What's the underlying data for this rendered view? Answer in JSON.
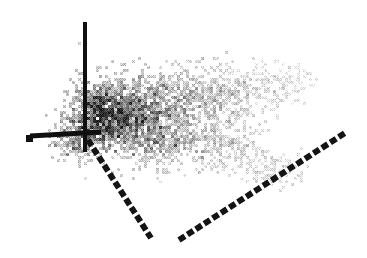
{
  "figure": {
    "name": "3d-scatter-plot",
    "width": 367,
    "height": 258,
    "background_color": "#ffffff",
    "render_style": "dithered-halftone-grayscale",
    "alt_text": "Low-resolution dithered grayscale 3D scatter plot showing a comet-shaped point cloud with three coordinate axes"
  },
  "chart_data": {
    "type": "scatter",
    "title": "",
    "subtitle": "",
    "xlabel": "",
    "ylabel": "",
    "zlabel": "",
    "legend": [],
    "annotations": [],
    "grid": false,
    "axes_labels_visible": false,
    "tick_labels_visible": false,
    "projection": "3d-isometric",
    "origin": {
      "x": 85,
      "y": 133
    },
    "axes": [
      {
        "name": "vertical-axis",
        "style": "solid",
        "color": "#101010",
        "thickness": 4,
        "from": {
          "x": 85,
          "y": 22
        },
        "to": {
          "x": 85,
          "y": 152
        },
        "cap": "square"
      },
      {
        "name": "horizontal-left-axis",
        "style": "solid",
        "color": "#101010",
        "thickness": 5,
        "from": {
          "x": 30,
          "y": 136
        },
        "to": {
          "x": 101,
          "y": 132
        },
        "cap": "square"
      },
      {
        "name": "depth-axis-front-left",
        "style": "dashed",
        "color": "#141414",
        "thickness": 6,
        "dash": 7,
        "gap": 3,
        "from": {
          "x": 88,
          "y": 140
        },
        "to": {
          "x": 151,
          "y": 238
        },
        "cap": "square"
      },
      {
        "name": "depth-axis-front-right",
        "style": "dashed",
        "color": "#141414",
        "thickness": 6,
        "dash": 7,
        "gap": 3,
        "from": {
          "x": 179,
          "y": 240
        },
        "to": {
          "x": 345,
          "y": 133
        },
        "cap": "square"
      }
    ],
    "cloud": {
      "shape": "comet-fan",
      "x_range": [
        55,
        312
      ],
      "y_range": [
        60,
        192
      ],
      "point_count": 2600,
      "density_peak": {
        "x": 112,
        "y": 118
      },
      "gray_min": "#3a3a3a",
      "gray_max": "#f0f0f0",
      "description": "Dense dark core near origin fading rightward to sparse light-gray specks",
      "lobes": [
        {
          "cx": 112,
          "cy": 118,
          "rx": 34,
          "ry": 30,
          "darkness": 0.92,
          "count": 620
        },
        {
          "cx": 96,
          "cy": 110,
          "rx": 26,
          "ry": 34,
          "darkness": 0.88,
          "count": 420
        },
        {
          "cx": 145,
          "cy": 108,
          "rx": 42,
          "ry": 34,
          "darkness": 0.7,
          "count": 520
        },
        {
          "cx": 150,
          "cy": 140,
          "rx": 38,
          "ry": 26,
          "darkness": 0.62,
          "count": 300
        },
        {
          "cx": 190,
          "cy": 100,
          "rx": 44,
          "ry": 32,
          "darkness": 0.5,
          "count": 360
        },
        {
          "cx": 196,
          "cy": 142,
          "rx": 40,
          "ry": 26,
          "darkness": 0.44,
          "count": 220
        },
        {
          "cx": 232,
          "cy": 96,
          "rx": 40,
          "ry": 28,
          "darkness": 0.34,
          "count": 210
        },
        {
          "cx": 238,
          "cy": 150,
          "rx": 34,
          "ry": 24,
          "darkness": 0.28,
          "count": 140
        },
        {
          "cx": 268,
          "cy": 86,
          "rx": 32,
          "ry": 22,
          "darkness": 0.2,
          "count": 110
        },
        {
          "cx": 272,
          "cy": 172,
          "rx": 28,
          "ry": 16,
          "darkness": 0.22,
          "count": 90
        },
        {
          "cx": 75,
          "cy": 138,
          "rx": 22,
          "ry": 24,
          "darkness": 0.72,
          "count": 180
        },
        {
          "cx": 300,
          "cy": 78,
          "rx": 22,
          "ry": 16,
          "darkness": 0.1,
          "count": 40
        }
      ],
      "stragglers": [
        {
          "x": 288,
          "y": 68,
          "gray": "#d8d8d8"
        },
        {
          "x": 297,
          "y": 63,
          "gray": "#e2e2e2"
        },
        {
          "x": 262,
          "y": 66,
          "gray": "#cfcfcf"
        },
        {
          "x": 258,
          "y": 72,
          "gray": "#dcdcdc"
        },
        {
          "x": 253,
          "y": 133,
          "gray": "#e0e0e0"
        },
        {
          "x": 160,
          "y": 180,
          "gray": "#dadada"
        },
        {
          "x": 86,
          "y": 178,
          "gray": "#d2d2d2"
        },
        {
          "x": 308,
          "y": 72,
          "gray": "#ececec"
        }
      ]
    }
  }
}
